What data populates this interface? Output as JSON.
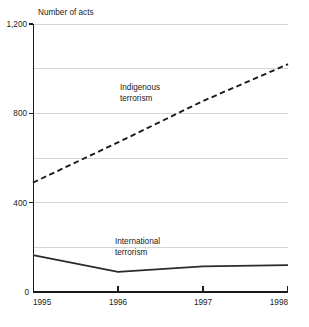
{
  "chart_data": {
    "type": "line",
    "title": "",
    "ylabel": "Number of acts",
    "xlabel": "",
    "x": [
      "1995",
      "1996",
      "1997",
      "1998"
    ],
    "categories": [
      "1995",
      "1996",
      "1997",
      "1998"
    ],
    "series": [
      {
        "name": "Indigenous terrorism",
        "values": [
          490,
          670,
          855,
          1020
        ],
        "style": "dashed"
      },
      {
        "name": "International terrorism",
        "values": [
          165,
          90,
          115,
          120
        ],
        "style": "solid"
      }
    ],
    "ylim": [
      0,
      1200
    ],
    "ytick_labels": [
      "0",
      "400",
      "800",
      "1,200"
    ],
    "ytick_values": [
      0,
      400,
      800,
      1200
    ],
    "gridline_values": [
      200,
      400,
      600,
      800,
      1000,
      1200
    ],
    "grid": true,
    "legend": "inline-annotations",
    "annotations": [
      {
        "text_line1": "Indigenous",
        "text_line2": "terrorism",
        "series": "Indigenous terrorism"
      },
      {
        "text_line1": "International",
        "text_line2": "terrorism",
        "series": "International terrorism"
      }
    ],
    "colors": {
      "line": "#1a1a1a",
      "grid": "#b9b9b9",
      "axis": "#1a1a1a",
      "background": "#ffffff"
    }
  },
  "axis": {
    "y_title": "Number of acts",
    "y_labels": {
      "t1200": "1,200",
      "t800": "800",
      "t400": "400",
      "t0": "0"
    },
    "x_labels": {
      "x1995": "1995",
      "x1996": "1996",
      "x1997": "1997",
      "x1998": "1998"
    }
  },
  "labels": {
    "indigenous_line1": "Indigenous",
    "indigenous_line2": "terrorism",
    "international_line1": "International",
    "international_line2": "terrorism"
  }
}
